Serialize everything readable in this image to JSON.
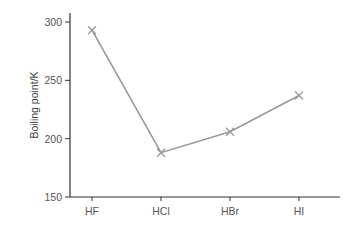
{
  "chart_data": {
    "type": "line",
    "title": "",
    "xlabel": "",
    "ylabel": "Boiling point/K",
    "categories": [
      "HF",
      "HCl",
      "HBr",
      "HI"
    ],
    "series": [
      {
        "name": "Boiling point",
        "values": [
          293,
          188,
          206,
          237
        ],
        "marker": "x",
        "color": "#999999"
      }
    ],
    "yticks": [
      150,
      200,
      250,
      300
    ],
    "ylim": [
      150,
      310
    ],
    "grid": false,
    "legend": "none"
  },
  "colors": {
    "axis": "#333333",
    "line": "#999999",
    "text": "#555555"
  }
}
